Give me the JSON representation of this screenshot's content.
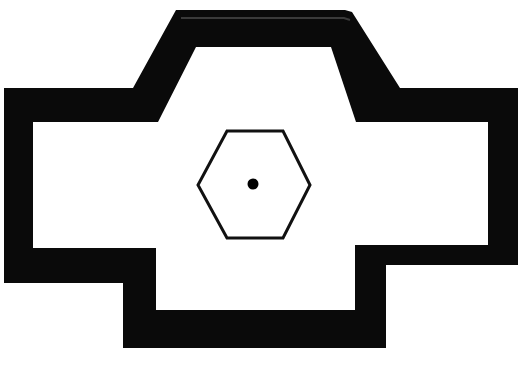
{
  "figure": {
    "canvas_width": 524,
    "canvas_height": 373,
    "background_color": "#ffffff",
    "ink_color": "#000000"
  },
  "shapes": {
    "wall_mass": {
      "name": "thick-black-wall-outline",
      "fill_color": "#0a0a0a",
      "description": "Filled black wall band forming a cruciform plan with chamfered upper-centre projection and stepped lateral wings",
      "outer_points": "176,10 345,10 352,12 400,88 518,88 518,265 386,265 386,348 123,348 123,283 4,283 4,88 133,88",
      "inner_points": "196,47 331,47 356,122 488,122 488,245 355,245 355,310 156,310 156,248 33,248 33,122 158,122"
    },
    "hexagon": {
      "name": "central-hexagon",
      "fill_color": "#ffffff",
      "stroke_color": "#111111",
      "stroke_width": 3,
      "points": "227,131 283,131 310,185 283,238 227,238 198,185",
      "center_x": 254,
      "center_y": 185
    },
    "center_dot": {
      "name": "centre-point-marker",
      "fill_color": "#000000",
      "cx": 253,
      "cy": 184,
      "r": 5.5
    }
  },
  "labels": {
    "none_visible": ""
  }
}
